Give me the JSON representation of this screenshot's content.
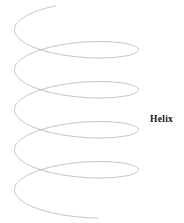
{
  "figure": {
    "width": 184,
    "height": 223,
    "background_color": "#ffffff",
    "label": "Helix",
    "label_color": "#141414",
    "curve_color": "#a9a9a9",
    "curve_width": 0.7
  },
  "chart_data": {
    "type": "line",
    "title": "Helix",
    "xlabel": "",
    "ylabel": "",
    "parametric": {
      "x_formula": "cx + rx * sin(t)",
      "y_formula": "cy0 + pitch * (t / (2*PI)) + ry * cos(t)",
      "center_x": 76.5,
      "radius_x": 62,
      "radius_y": 17,
      "pitch": 40,
      "t_start_deg": 200,
      "t_end_deg": 1820,
      "turns": 4.5,
      "y_start": 6,
      "y_end": 218
    },
    "axis_ranges": {
      "x": [
        14,
        139
      ],
      "y": [
        6,
        218
      ]
    },
    "grid": false,
    "legend": false,
    "annotations": [
      {
        "text": "Helix",
        "x": 151,
        "y": 119
      }
    ],
    "turn_centers_y": [
      25,
      65,
      105,
      145,
      185
    ],
    "series": [
      {
        "name": "helix",
        "color": "#a9a9a9",
        "points_x": [
          86.4,
          110.1,
          126.7,
          135.6,
          136.2,
          128.5,
          113.5,
          93.1,
          70.0,
          47.1,
          26.9,
          21.5,
          15.8,
          14.5,
          18.0,
          26.4,
          39.3,
          55.7,
          74.5,
          94.0,
          112.0,
          126.7,
          135.5,
          138.9,
          136.1,
          127.5,
          113.9,
          96.8,
          78.0,
          59.0,
          41.6,
          27.2,
          18.4,
          14.9,
          16.5,
          23.7,
          35.6,
          51.1,
          69.0,
          87.8,
          106.2,
          121.8,
          132.9,
          138.4,
          138.0,
          131.6,
          119.9,
          104.2,
          86.0,
          67.0,
          48.8,
          33.3,
          22.1,
          16.6,
          17.0,
          23.4,
          35.1,
          50.8,
          69.0,
          88.0,
          106.2,
          121.8,
          132.9,
          138.4,
          138.0,
          131.6,
          119.9,
          104.2,
          86.0,
          67.0,
          48.8,
          33.2,
          22.1,
          16.6,
          17.0,
          23.4,
          35.1,
          50.8,
          69.0,
          88.0,
          106.0,
          120.4,
          129.6,
          132.9,
          130.0,
          121.3,
          107.6,
          95.0
        ],
        "points_y": [
          6.0,
          12.5,
          21.0,
          30.5,
          40.5,
          50.0,
          58.5,
          65.0,
          69.5,
          71.5,
          70.5,
          68.0,
          62.5,
          55.5,
          48.0,
          41.0,
          35.0,
          31.0,
          29.5,
          31.0,
          35.0,
          41.0,
          49.0,
          58.0,
          67.5,
          76.5,
          84.5,
          91.0,
          95.5,
          97.5,
          97.0,
          94.0,
          89.0,
          82.5,
          75.0,
          68.5,
          63.5,
          61.0,
          61.0,
          64.0,
          69.0,
          76.0,
          84.5,
          93.5,
          102.5,
          111.0,
          118.5,
          124.5,
          128.5,
          130.0,
          129.0,
          125.5,
          120.0,
          113.5,
          106.5,
          100.5,
          96.0,
          93.5,
          93.5,
          96.0,
          101.0,
          108.0,
          116.5,
          125.5,
          134.5,
          143.0,
          150.5,
          156.5,
          160.5,
          162.0,
          161.0,
          157.5,
          152.0,
          145.5,
          138.5,
          132.5,
          128.0,
          125.5,
          125.5,
          128.0,
          133.0,
          140.0,
          148.5,
          157.5,
          166.5,
          175.0,
          182.5,
          188.5
        ]
      }
    ]
  }
}
